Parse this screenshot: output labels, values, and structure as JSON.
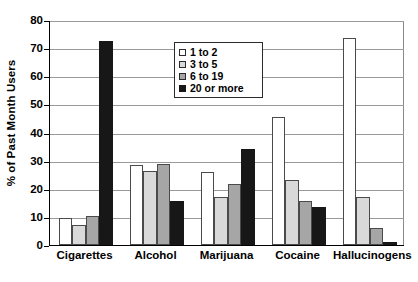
{
  "chart_data": {
    "type": "bar",
    "title": "",
    "subtitle": "",
    "xlabel": "",
    "ylabel": "% of Past Month Users",
    "ylim": [
      0,
      80
    ],
    "yticks": [
      0,
      10,
      20,
      30,
      40,
      50,
      60,
      70,
      80
    ],
    "ytick_labels": [
      "0",
      "10",
      "20",
      "30",
      "40",
      "50",
      "60",
      "70",
      "80"
    ],
    "grid": true,
    "legend_position": "upper-center",
    "categories": [
      "Cigarettes",
      "Alcohol",
      "Marijuana",
      "Cocaine",
      "Hallucinogens"
    ],
    "series": [
      {
        "name": "1 to 2",
        "color": "#ffffff",
        "values": [
          9.7,
          28.4,
          25.9,
          45.6,
          73.5
        ]
      },
      {
        "name": "3 to 5",
        "color": "#d9d9d9",
        "values": [
          7.0,
          26.3,
          17.1,
          23.1,
          17.0
        ]
      },
      {
        "name": "6 to 19",
        "color": "#a6a6a6",
        "values": [
          10.4,
          28.8,
          21.7,
          15.5,
          5.9
        ]
      },
      {
        "name": "20 or more",
        "color": "#171717",
        "values": [
          72.5,
          15.6,
          34.2,
          13.6,
          1.0
        ]
      }
    ]
  },
  "axis": {
    "y_title": "% of Past Month Users"
  },
  "legend": {
    "items": [
      {
        "label": "1 to 2"
      },
      {
        "label": "3 to 5"
      },
      {
        "label": "6 to 19"
      },
      {
        "label": "20 or more"
      }
    ]
  }
}
